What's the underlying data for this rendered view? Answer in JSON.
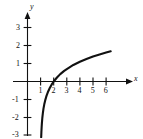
{
  "chart_data": {
    "type": "line",
    "title": "",
    "subtitle": "",
    "xlabel": "x",
    "ylabel": "y",
    "function": "y = ln(x - 1)",
    "grid": false,
    "legend": null,
    "xlim": [
      -0.6,
      7.1
    ],
    "ylim": [
      -3.4,
      3.6
    ],
    "x_ticks": [
      1,
      2,
      3,
      4,
      5,
      6
    ],
    "x_tick_labels": [
      "1",
      "2",
      "3",
      "4",
      "5",
      "6"
    ],
    "y_ticks": [
      3,
      2,
      1,
      -1,
      -2,
      -3
    ],
    "y_tick_labels": [
      "3",
      "2",
      "1",
      "-1",
      "-2",
      "-3"
    ],
    "x_intercept": 2,
    "vertical_asymptote": 1,
    "domain_drawn": [
      1.045,
      6.35
    ],
    "curve_color": "#111111",
    "axis_color": "#111111",
    "background": "#ffffff",
    "points": [
      {
        "x": 1.045,
        "y": -3.1
      },
      {
        "x": 1.06,
        "y": -2.81
      },
      {
        "x": 1.08,
        "y": -2.53
      },
      {
        "x": 1.1,
        "y": -2.3
      },
      {
        "x": 1.13,
        "y": -2.04
      },
      {
        "x": 1.17,
        "y": -1.77
      },
      {
        "x": 1.22,
        "y": -1.51
      },
      {
        "x": 1.28,
        "y": -1.27
      },
      {
        "x": 1.35,
        "y": -1.05
      },
      {
        "x": 1.45,
        "y": -0.8
      },
      {
        "x": 1.55,
        "y": -0.6
      },
      {
        "x": 1.7,
        "y": -0.36
      },
      {
        "x": 1.85,
        "y": -0.16
      },
      {
        "x": 2.0,
        "y": 0.0
      },
      {
        "x": 2.25,
        "y": 0.22
      },
      {
        "x": 2.5,
        "y": 0.41
      },
      {
        "x": 2.8,
        "y": 0.59
      },
      {
        "x": 3.0,
        "y": 0.69
      },
      {
        "x": 3.5,
        "y": 0.92
      },
      {
        "x": 4.0,
        "y": 1.1
      },
      {
        "x": 4.5,
        "y": 1.25
      },
      {
        "x": 5.0,
        "y": 1.39
      },
      {
        "x": 5.5,
        "y": 1.5
      },
      {
        "x": 6.0,
        "y": 1.61
      },
      {
        "x": 6.35,
        "y": 1.68
      }
    ]
  },
  "axes": {
    "x_name": "x",
    "y_name": "y"
  }
}
